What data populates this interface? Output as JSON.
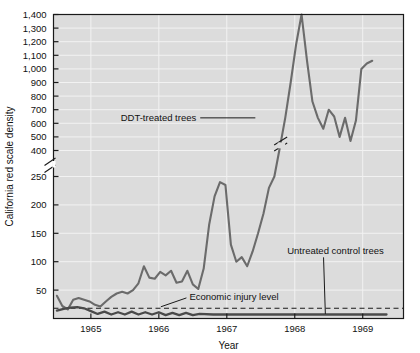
{
  "chart_data": {
    "type": "line",
    "title": "",
    "xlabel": "Year",
    "ylabel": "California red scale density",
    "grid": true,
    "legend_position": "inline-annotations",
    "plot_background": "#dcdcdc",
    "axis_break": {
      "present": true,
      "between": [
        250,
        400
      ],
      "note": "broken y-axis; marks drawn on axis and on the DDT-treated series"
    },
    "xlim": [
      1964.45,
      1969.6
    ],
    "ylim_lower": [
      0,
      250
    ],
    "ylim_upper": [
      400,
      1400
    ],
    "x_ticks": [
      1965,
      1966,
      1967,
      1968,
      1969
    ],
    "x_tick_labels": [
      "1965",
      "1966",
      "1967",
      "1968",
      "1969"
    ],
    "y_ticks": [
      50,
      100,
      150,
      200,
      250,
      400,
      500,
      600,
      700,
      800,
      900,
      1000,
      1100,
      1200,
      1300,
      1400
    ],
    "y_tick_labels": [
      "50",
      "100",
      "150",
      "200",
      "250",
      "400",
      "500",
      "600",
      "700",
      "800",
      "900",
      "1,000",
      "1,100",
      "1,200",
      "1,300",
      "1,400"
    ],
    "annotations": [
      {
        "text": "DDT-treated trees",
        "x": 1966.55,
        "y": 640,
        "leader": true
      },
      {
        "text": "Untreated control trees",
        "x": 1968.6,
        "y": 120,
        "leader": true
      },
      {
        "text": "Economic injury level",
        "x": 1966.45,
        "y": 38,
        "leader": true
      }
    ],
    "reference_line": {
      "label": "Economic injury level",
      "value": 18,
      "style": "dashed"
    },
    "series": [
      {
        "name": "DDT-treated trees",
        "color": "#6b6b6b",
        "x": [
          1964.5,
          1964.58,
          1964.66,
          1964.74,
          1964.82,
          1964.9,
          1964.98,
          1965.06,
          1965.14,
          1965.22,
          1965.3,
          1965.38,
          1965.46,
          1965.54,
          1965.62,
          1965.7,
          1965.78,
          1965.86,
          1965.94,
          1966.02,
          1966.1,
          1966.18,
          1966.26,
          1966.34,
          1966.42,
          1966.5,
          1966.58,
          1966.66,
          1966.74,
          1966.82,
          1966.9,
          1966.98,
          1967.06,
          1967.14,
          1967.22,
          1967.3,
          1967.38,
          1967.46,
          1967.54,
          1967.62,
          1967.7,
          1967.78,
          1967.86,
          1967.94,
          1968.02,
          1968.1,
          1968.18,
          1968.26,
          1968.34,
          1968.42,
          1968.5,
          1968.58,
          1968.66,
          1968.74,
          1968.82,
          1968.9,
          1968.98,
          1969.06,
          1969.14
        ],
        "y": [
          40,
          22,
          16,
          33,
          36,
          33,
          30,
          24,
          21,
          30,
          38,
          44,
          47,
          44,
          50,
          62,
          92,
          72,
          70,
          82,
          76,
          84,
          63,
          65,
          84,
          60,
          52,
          88,
          165,
          215,
          240,
          235,
          130,
          100,
          108,
          92,
          118,
          150,
          185,
          230,
          250,
          420,
          640,
          900,
          1180,
          1400,
          1060,
          760,
          640,
          560,
          700,
          650,
          500,
          640,
          470,
          620,
          1000,
          1040,
          1060
        ]
      },
      {
        "name": "Untreated control trees",
        "color": "#4a4a4a",
        "x": [
          1964.5,
          1964.6,
          1964.7,
          1964.8,
          1964.9,
          1965.0,
          1965.1,
          1965.2,
          1965.3,
          1965.4,
          1965.5,
          1965.6,
          1965.7,
          1965.8,
          1965.9,
          1966.0,
          1966.1,
          1966.2,
          1966.3,
          1966.4,
          1966.5,
          1966.6,
          1966.8,
          1967.0,
          1967.3,
          1967.6,
          1967.9,
          1968.2,
          1968.5,
          1968.8,
          1969.1,
          1969.35
        ],
        "y": [
          14,
          17,
          19,
          20,
          18,
          13,
          8,
          12,
          7,
          11,
          7,
          12,
          7,
          11,
          7,
          11,
          6,
          10,
          6,
          10,
          6,
          8,
          7,
          7,
          7,
          7,
          7,
          7,
          7,
          7,
          7,
          7
        ]
      }
    ]
  }
}
